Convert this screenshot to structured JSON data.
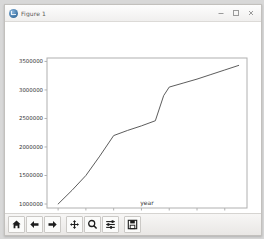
{
  "window": {
    "title": "Figure 1",
    "icon": "matplotlib-figure-icon",
    "controls": [
      {
        "name": "minimize-button",
        "label": "–"
      },
      {
        "name": "maximize-button",
        "label": "□"
      },
      {
        "name": "close-button",
        "label": "×"
      }
    ]
  },
  "toolbar": {
    "buttons": [
      {
        "name": "home-button",
        "icon": "home-icon",
        "tooltip": "Reset original view"
      },
      {
        "name": "back-button",
        "icon": "arrow-left-icon",
        "tooltip": "Back to previous view"
      },
      {
        "name": "forward-button",
        "icon": "arrow-right-icon",
        "tooltip": "Forward to next view"
      },
      {
        "name": "pan-button",
        "icon": "move-cross-icon",
        "tooltip": "Pan axes with left mouse, zoom with right"
      },
      {
        "name": "zoom-button",
        "icon": "magnifier-icon",
        "tooltip": "Zoom to rectangle"
      },
      {
        "name": "subplots-button",
        "icon": "sliders-icon",
        "tooltip": "Configure subplots"
      },
      {
        "name": "save-button",
        "icon": "floppy-disk-icon",
        "tooltip": "Save the figure"
      }
    ]
  },
  "chart_data": {
    "type": "line",
    "title": "",
    "xlabel": "year",
    "ylabel": "",
    "xlim": [
      1946,
      2018
    ],
    "ylim": [
      930000,
      3560000
    ],
    "xticks": [
      1950,
      1960,
      1970,
      1980,
      1990,
      2000,
      2010
    ],
    "xticklabels": [
      "1950",
      "1960",
      "1970",
      "1980",
      "1990",
      "2000",
      "2010"
    ],
    "yticks": [
      1000000,
      1500000,
      2000000,
      2500000,
      3000000,
      3500000
    ],
    "yticklabels": [
      "1000000",
      "1500000",
      "2000000",
      "2500000",
      "3000000",
      "3500000"
    ],
    "grid": false,
    "legend": null,
    "line_color": "#4a4a4a",
    "line_width": 0.9,
    "x": [
      1950,
      1955,
      1960,
      1965,
      1970,
      1975,
      1980,
      1985,
      1988,
      1990,
      1995,
      2000,
      2005,
      2010,
      2015
    ],
    "y": [
      1000000,
      1240000,
      1500000,
      1840000,
      2200000,
      2290000,
      2370000,
      2460000,
      2900000,
      3050000,
      3120000,
      3190000,
      3270000,
      3350000,
      3430000
    ],
    "series": [
      {
        "name": "population",
        "values": [
          1000000,
          1240000,
          1500000,
          1840000,
          2200000,
          2290000,
          2370000,
          2460000,
          2900000,
          3050000,
          3120000,
          3190000,
          3270000,
          3350000,
          3430000
        ]
      }
    ]
  }
}
